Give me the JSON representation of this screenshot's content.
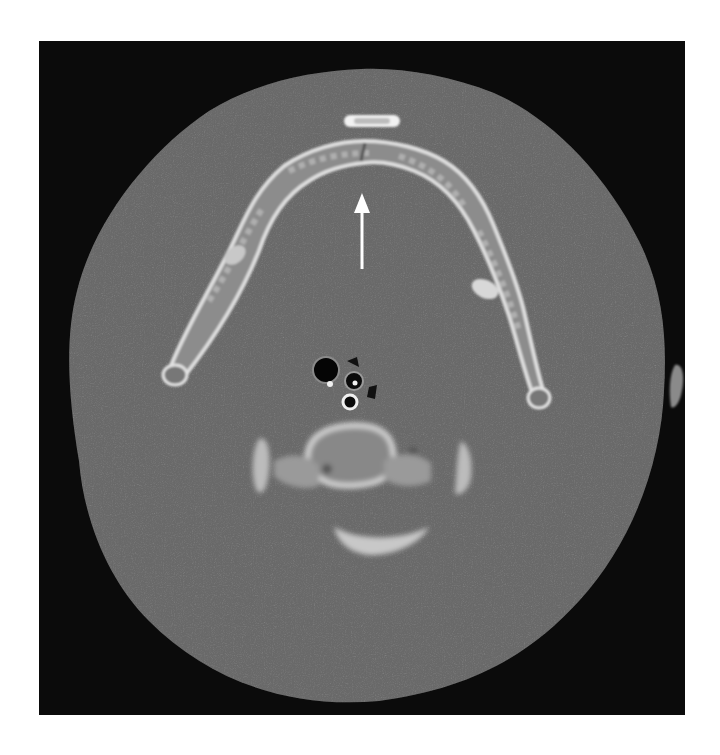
{
  "image": {
    "modality": "CT axial slice",
    "region": "neck / mandible level",
    "window": "bone window",
    "annotations": [
      {
        "type": "arrow",
        "color": "#ffffff",
        "direction": "up",
        "target": "mandibular symphysis fracture line"
      }
    ],
    "colors": {
      "background": "#0b0b0b",
      "soft_tissue": "#6b6b6b",
      "bone": "#d9d9d9",
      "air": "#050505",
      "page": "#ffffff"
    }
  }
}
